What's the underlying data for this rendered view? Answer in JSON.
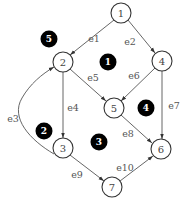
{
  "diagram": {
    "type": "directed-planar-graph",
    "nodes": [
      {
        "id": "1",
        "label": "1",
        "x": 121,
        "y": 13
      },
      {
        "id": "2",
        "label": "2",
        "x": 63,
        "y": 62
      },
      {
        "id": "3",
        "label": "3",
        "x": 63,
        "y": 148
      },
      {
        "id": "4",
        "label": "4",
        "x": 162,
        "y": 61
      },
      {
        "id": "5",
        "label": "5",
        "x": 114,
        "y": 108
      },
      {
        "id": "6",
        "label": "6",
        "x": 161,
        "y": 149
      },
      {
        "id": "7",
        "label": "7",
        "x": 112,
        "y": 187
      }
    ],
    "edges": [
      {
        "id": "e1",
        "label": "e1",
        "from": "1",
        "to": "2",
        "lx": 94,
        "ly": 38
      },
      {
        "id": "e2",
        "label": "e2",
        "from": "1",
        "to": "4",
        "lx": 130,
        "ly": 41
      },
      {
        "id": "e3",
        "label": "e3",
        "from": "3",
        "to": "2",
        "lx": 13,
        "ly": 118
      },
      {
        "id": "e4",
        "label": "e4",
        "from": "2",
        "to": "3",
        "lx": 73,
        "ly": 107
      },
      {
        "id": "e5",
        "label": "e5",
        "from": "2",
        "to": "5",
        "lx": 93,
        "ly": 77
      },
      {
        "id": "e6",
        "label": "e6",
        "from": "4",
        "to": "5",
        "lx": 134,
        "ly": 75
      },
      {
        "id": "e7",
        "label": "e7",
        "from": "4",
        "to": "6",
        "lx": 174,
        "ly": 105
      },
      {
        "id": "e8",
        "label": "e8",
        "from": "5",
        "to": "6",
        "lx": 128,
        "ly": 133
      },
      {
        "id": "e9",
        "label": "e9",
        "from": "3",
        "to": "7",
        "lx": 77,
        "ly": 174
      },
      {
        "id": "e10",
        "label": "e10",
        "from": "7",
        "to": "6",
        "lx": 125,
        "ly": 167
      }
    ],
    "faces": [
      {
        "id": "f1",
        "label": "1",
        "x": 108,
        "y": 62
      },
      {
        "id": "f2",
        "label": "2",
        "x": 44,
        "y": 131
      },
      {
        "id": "f3",
        "label": "3",
        "x": 99,
        "y": 142
      },
      {
        "id": "f4",
        "label": "4",
        "x": 146,
        "y": 108
      },
      {
        "id": "f5",
        "label": "5",
        "x": 49,
        "y": 39
      }
    ]
  }
}
